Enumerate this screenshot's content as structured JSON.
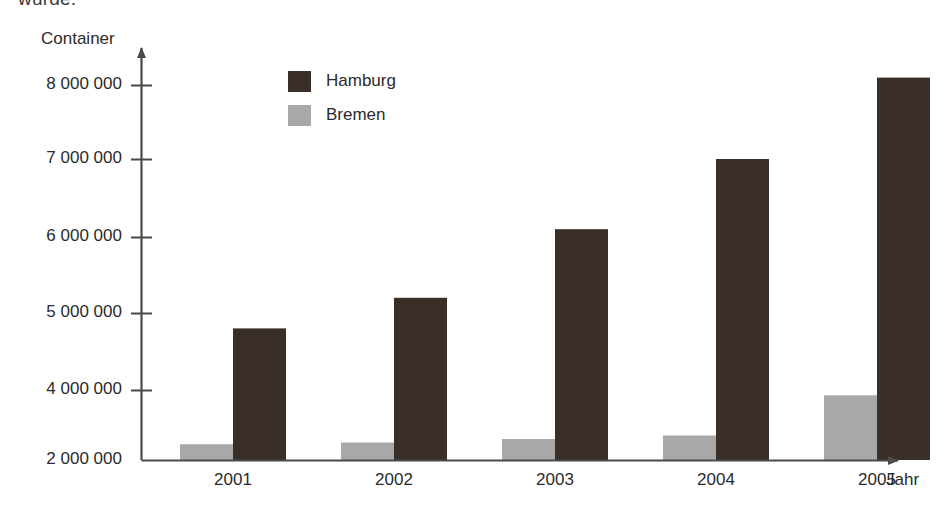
{
  "page": {
    "top_cut_text": "wurde."
  },
  "chart_data": {
    "type": "bar",
    "title": "",
    "xlabel": "Jahr",
    "ylabel": "Container",
    "categories": [
      "2001",
      "2002",
      "2003",
      "2004",
      "2005"
    ],
    "series": [
      {
        "name": "Hamburg",
        "color": "#3a2e28",
        "values": [
          4800000,
          5200000,
          6100000,
          7000000,
          8100000
        ]
      },
      {
        "name": "Bremen",
        "color": "#a8a8a8",
        "values": [
          2450000,
          2500000,
          2600000,
          2700000,
          3850000
        ]
      }
    ],
    "ytick_labels": [
      "8 000 000",
      "7 000 000",
      "6 000 000",
      "5 000 000",
      "4 000 000",
      "2 000 000"
    ],
    "ytick_values": [
      8000000,
      7000000,
      6000000,
      5000000,
      4000000,
      2000000
    ],
    "ylim": [
      2000000,
      8400000
    ],
    "axis_broken": true,
    "axis_break_note": "y-axis skips from 2 000 000 directly to 4 000 000",
    "grid": false,
    "legend_position": "top-center",
    "axis_style": "arrow-ended L-axes"
  },
  "colors": {
    "hamburg": "#3a2e28",
    "bremen": "#a8a8a8",
    "axis": "#4a4a4a",
    "text": "#2b2b2b",
    "background": "#ffffff"
  }
}
